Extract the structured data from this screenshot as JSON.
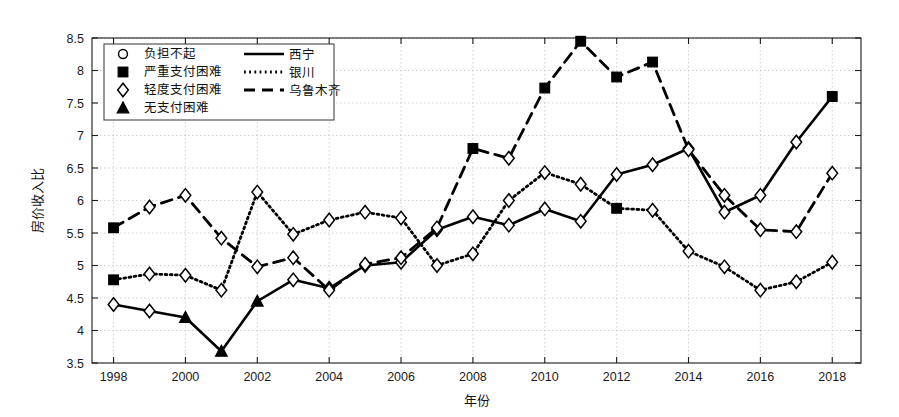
{
  "chart_data": {
    "type": "line",
    "title": "",
    "xlabel": "年份",
    "ylabel": "房价收入比",
    "xlim": [
      1997.4,
      2018.8
    ],
    "ylim": [
      3.5,
      8.5
    ],
    "grid": true,
    "legend_position": "upper-left",
    "x": [
      1998,
      1999,
      2000,
      2001,
      2002,
      2003,
      2004,
      2005,
      2006,
      2007,
      2008,
      2009,
      2010,
      2011,
      2012,
      2013,
      2014,
      2015,
      2016,
      2017,
      2018
    ],
    "xticks": [
      "1998",
      "2000",
      "2002",
      "2004",
      "2006",
      "2008",
      "2010",
      "2012",
      "2014",
      "2016",
      "2018"
    ],
    "xtick_values": [
      1998,
      2000,
      2002,
      2004,
      2006,
      2008,
      2010,
      2012,
      2014,
      2016,
      2018
    ],
    "yticks": [
      "3.5",
      "4",
      "4.5",
      "5",
      "5.5",
      "6",
      "6.5",
      "7",
      "7.5",
      "8",
      "8.5"
    ],
    "ytick_values": [
      3.5,
      4,
      4.5,
      5,
      5.5,
      6,
      6.5,
      7,
      7.5,
      8,
      8.5
    ],
    "series": [
      {
        "name": "西宁",
        "linestyle": "solid",
        "values": [
          4.4,
          4.3,
          4.2,
          3.68,
          4.45,
          4.78,
          4.65,
          5.0,
          5.05,
          5.55,
          5.75,
          5.62,
          5.87,
          5.68,
          6.4,
          6.55,
          6.8,
          5.82,
          6.08,
          6.9,
          7.6
        ],
        "markers": [
          "mild",
          "mild",
          "none",
          "none",
          "none",
          "none",
          "none",
          "none",
          "none",
          "mild",
          "mild",
          "mild",
          "mild",
          "mild",
          "mild",
          "mild",
          "mild",
          "none",
          "none",
          "none",
          "none"
        ]
      },
      {
        "name": "银川",
        "linestyle": "dotted",
        "values": [
          4.78,
          4.87,
          4.85,
          4.62,
          6.13,
          5.48,
          5.7,
          5.82,
          5.73,
          5.0,
          5.18,
          6.0,
          6.43,
          6.25,
          5.88,
          5.85,
          5.22,
          4.98,
          4.62,
          4.75,
          5.05
        ],
        "markers": [
          "severe",
          "mild",
          "mild",
          "mild",
          "mild",
          "mild",
          "mild",
          "mild",
          "mild",
          "mild",
          "mild",
          "mild",
          "mild",
          "mild",
          "severe",
          "mild",
          "mild",
          "none",
          "none",
          "none",
          "none"
        ]
      },
      {
        "name": "乌鲁木齐",
        "linestyle": "dashed",
        "values": [
          5.58,
          5.9,
          6.08,
          5.42,
          4.98,
          5.12,
          4.62,
          5.02,
          5.12,
          5.58,
          6.8,
          6.65,
          7.73,
          8.45,
          7.9,
          8.13,
          6.78,
          6.08,
          5.55,
          5.52,
          6.42
        ],
        "markers": [
          "severe",
          "mild",
          "mild",
          "mild",
          "none",
          "mild",
          "none",
          "mild",
          "mild",
          "mild",
          "severe",
          "mild",
          "severe",
          "severe",
          "severe",
          "severe",
          "mild",
          "mild",
          "none",
          "none",
          "none"
        ]
      }
    ],
    "marker_legend": [
      {
        "marker": "circle",
        "label": "负担不起"
      },
      {
        "marker": "square",
        "label": "严重支付困难"
      },
      {
        "marker": "diamond",
        "label": "轻度支付困难"
      },
      {
        "marker": "triangle",
        "label": "无支付困难"
      }
    ],
    "line_legend": [
      {
        "linestyle": "solid",
        "label": "西宁"
      },
      {
        "linestyle": "dotted",
        "label": "银川"
      },
      {
        "linestyle": "dashed",
        "label": "乌鲁木齐"
      }
    ],
    "colors": {
      "line": "#000000",
      "grid": "#c9c9c9",
      "axis": "#1a1a1a",
      "background": "#ffffff"
    }
  }
}
